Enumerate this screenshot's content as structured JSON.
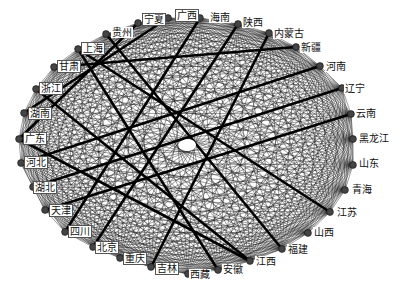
{
  "diagram": {
    "type": "circular-network",
    "center": [
      187,
      145
    ],
    "radii": [
      168,
      128
    ],
    "node_color": "#444444",
    "edge_color": "#111111",
    "nodes": [
      {
        "id": "宁夏",
        "x": 138,
        "y": 23,
        "lx": 143,
        "ly": 14
      },
      {
        "id": "广西",
        "x": 168,
        "y": 18,
        "lx": 176,
        "ly": 10
      },
      {
        "id": "海南",
        "x": 200,
        "y": 18,
        "lx": 209,
        "ly": 12
      },
      {
        "id": "陕西",
        "x": 238,
        "y": 24,
        "lx": 242,
        "ly": 17
      },
      {
        "id": "内蒙古",
        "x": 269,
        "y": 33,
        "lx": 273,
        "ly": 28
      },
      {
        "id": "新疆",
        "x": 296,
        "y": 47,
        "lx": 300,
        "ly": 42
      },
      {
        "id": "河南",
        "x": 320,
        "y": 66,
        "lx": 325,
        "ly": 61
      },
      {
        "id": "辽宁",
        "x": 342,
        "y": 88,
        "lx": 344,
        "ly": 83
      },
      {
        "id": "云南",
        "x": 351,
        "y": 114,
        "lx": 355,
        "ly": 108
      },
      {
        "id": "黑龙江",
        "x": 353,
        "y": 139,
        "lx": 358,
        "ly": 133
      },
      {
        "id": "山东",
        "x": 353,
        "y": 165,
        "lx": 358,
        "ly": 158
      },
      {
        "id": "青海",
        "x": 345,
        "y": 190,
        "lx": 351,
        "ly": 184
      },
      {
        "id": "江苏",
        "x": 330,
        "y": 212,
        "lx": 336,
        "ly": 207
      },
      {
        "id": "山西",
        "x": 308,
        "y": 233,
        "lx": 313,
        "ly": 227
      },
      {
        "id": "福建",
        "x": 282,
        "y": 249,
        "lx": 287,
        "ly": 244
      },
      {
        "id": "江西",
        "x": 250,
        "y": 261,
        "lx": 255,
        "ly": 256
      },
      {
        "id": "安徽",
        "x": 218,
        "y": 270,
        "lx": 222,
        "ly": 264
      },
      {
        "id": "西藏",
        "x": 188,
        "y": 274,
        "lx": 189,
        "ly": 269
      },
      {
        "id": "吉林",
        "x": 151,
        "y": 267,
        "lx": 156,
        "ly": 263
      },
      {
        "id": "重庆",
        "x": 120,
        "y": 258,
        "lx": 124,
        "ly": 253
      },
      {
        "id": "北京",
        "x": 93,
        "y": 247,
        "lx": 96,
        "ly": 242
      },
      {
        "id": "四川",
        "x": 65,
        "y": 232,
        "lx": 69,
        "ly": 226
      },
      {
        "id": "天津",
        "x": 45,
        "y": 210,
        "lx": 50,
        "ly": 205
      },
      {
        "id": "湖北",
        "x": 33,
        "y": 187,
        "lx": 34,
        "ly": 182
      },
      {
        "id": "河北",
        "x": 21,
        "y": 163,
        "lx": 25,
        "ly": 157
      },
      {
        "id": "广东",
        "x": 19,
        "y": 139,
        "lx": 24,
        "ly": 133
      },
      {
        "id": "湖南",
        "x": 24,
        "y": 113,
        "lx": 29,
        "ly": 108
      },
      {
        "id": "浙江",
        "x": 36,
        "y": 89,
        "lx": 40,
        "ly": 83
      },
      {
        "id": "甘肃",
        "x": 54,
        "y": 67,
        "lx": 58,
        "ly": 61
      },
      {
        "id": "上海",
        "x": 78,
        "y": 49,
        "lx": 82,
        "ly": 43
      },
      {
        "id": "贵州",
        "x": 106,
        "y": 34,
        "lx": 111,
        "ly": 27
      }
    ],
    "boxed_labels": [
      "宁夏",
      "广西",
      "上海",
      "甘肃",
      "浙江",
      "湖南",
      "广东",
      "河北",
      "湖北",
      "天津",
      "四川",
      "北京",
      "重庆",
      "吉林"
    ],
    "heavy_edges": [
      [
        "广东",
        "宁夏"
      ],
      [
        "湖南",
        "广西"
      ],
      [
        "上海",
        "江苏"
      ],
      [
        "上海",
        "安徽"
      ],
      [
        "浙江",
        "江西"
      ],
      [
        "广东",
        "江西"
      ],
      [
        "河北",
        "河南"
      ],
      [
        "甘肃",
        "新疆"
      ],
      [
        "天津",
        "云南"
      ],
      [
        "湖北",
        "辽宁"
      ],
      [
        "四川",
        "海南"
      ],
      [
        "北京",
        "陕西"
      ],
      [
        "吉林",
        "内蒙古"
      ],
      [
        "贵州",
        "福建"
      ]
    ],
    "edge_density": "complete-graph"
  }
}
